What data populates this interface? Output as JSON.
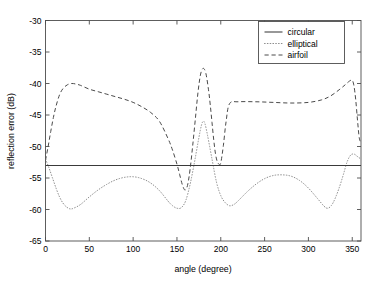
{
  "chart_data": {
    "type": "line",
    "title": "",
    "xlabel": "angle (degree)",
    "ylabel": "reflection error (dB)",
    "xlim": [
      0,
      360
    ],
    "ylim": [
      -65,
      -30
    ],
    "xticks": [
      0,
      50,
      100,
      150,
      200,
      250,
      300,
      350
    ],
    "yticks": [
      -65,
      -60,
      -55,
      -50,
      -45,
      -40,
      -35,
      -30
    ],
    "xticklabels": [
      "0",
      "50",
      "100",
      "150",
      "200",
      "250",
      "300",
      "350"
    ],
    "yticklabels": [
      "-65",
      "-60",
      "-55",
      "-50",
      "-45",
      "-40",
      "-35",
      "-30"
    ],
    "grid": false,
    "legend_position": "upper right",
    "legend_entries": [
      "circular",
      "elliptical",
      "airfoil"
    ],
    "series": [
      {
        "name": "circular",
        "style": "solid",
        "color": "#3a3a3a",
        "x": [
          0,
          360
        ],
        "values": [
          -53.0,
          -53.0
        ]
      },
      {
        "name": "elliptical",
        "style": "dotted",
        "color": "#8c8c8c",
        "x": [
          0,
          4,
          8,
          12,
          16,
          20,
          24,
          28,
          32,
          40,
          50,
          60,
          70,
          80,
          90,
          100,
          110,
          120,
          130,
          140,
          145,
          150,
          155,
          160,
          165,
          170,
          175,
          178,
          180,
          182,
          185,
          190,
          195,
          200,
          205,
          210,
          215,
          220,
          230,
          240,
          250,
          260,
          270,
          280,
          290,
          300,
          310,
          318,
          322,
          326,
          330,
          335,
          340,
          344,
          348,
          352,
          356,
          360
        ],
        "values": [
          -52.0,
          -53.4,
          -55.0,
          -56.6,
          -58.0,
          -59.0,
          -59.6,
          -59.9,
          -59.8,
          -59.2,
          -58.0,
          -56.9,
          -56.0,
          -55.3,
          -54.9,
          -54.8,
          -55.1,
          -55.8,
          -57.0,
          -58.7,
          -59.4,
          -59.8,
          -59.7,
          -58.6,
          -56.0,
          -52.5,
          -48.6,
          -46.6,
          -46.0,
          -46.4,
          -48.3,
          -52.0,
          -55.6,
          -57.8,
          -58.9,
          -59.4,
          -59.2,
          -58.6,
          -57.2,
          -56.0,
          -55.1,
          -54.6,
          -54.5,
          -54.7,
          -55.4,
          -56.6,
          -58.2,
          -59.5,
          -59.8,
          -59.4,
          -58.4,
          -56.6,
          -54.4,
          -52.5,
          -51.4,
          -51.2,
          -51.6,
          -52.0
        ]
      },
      {
        "name": "airfoil",
        "style": "dashed",
        "color": "#4a4a4a",
        "x": [
          0,
          3,
          6,
          9,
          12,
          16,
          20,
          25,
          30,
          35,
          40,
          50,
          60,
          70,
          80,
          90,
          100,
          110,
          120,
          130,
          140,
          145,
          150,
          153,
          156,
          159,
          162,
          165,
          168,
          171,
          174,
          177,
          180,
          183,
          186,
          188,
          190,
          192,
          194,
          196,
          198,
          200,
          203,
          206,
          210,
          220,
          240,
          260,
          280,
          300,
          315,
          325,
          335,
          342,
          347,
          350,
          352,
          354,
          356,
          358,
          360
        ],
        "values": [
          -52.2,
          -50.0,
          -47.6,
          -45.4,
          -43.6,
          -41.8,
          -40.8,
          -40.2,
          -40.0,
          -40.1,
          -40.3,
          -40.9,
          -41.3,
          -41.7,
          -42.1,
          -42.5,
          -43.0,
          -43.7,
          -44.6,
          -46.0,
          -48.8,
          -50.6,
          -52.8,
          -54.4,
          -56.0,
          -56.9,
          -56.2,
          -53.6,
          -49.8,
          -45.6,
          -41.4,
          -38.5,
          -37.6,
          -38.4,
          -41.0,
          -43.4,
          -46.2,
          -49.0,
          -51.2,
          -52.4,
          -52.8,
          -52.6,
          -49.8,
          -46.1,
          -43.2,
          -42.9,
          -42.9,
          -43.0,
          -43.1,
          -43.0,
          -42.6,
          -42.0,
          -41.0,
          -40.2,
          -39.6,
          -39.5,
          -40.4,
          -42.6,
          -45.8,
          -48.6,
          -49.4
        ]
      }
    ]
  },
  "axes": {
    "frame_color": "#4d4d4d"
  }
}
